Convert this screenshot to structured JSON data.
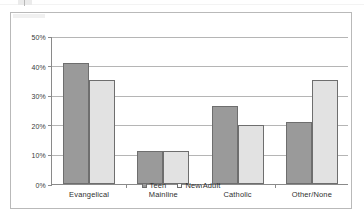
{
  "chart_data": {
    "type": "bar",
    "title": "",
    "subtitle": "",
    "xlabel": "",
    "ylabel": "",
    "categories": [
      "Evangelical",
      "Mainline",
      "Catholic",
      "Other/None"
    ],
    "series": [
      {
        "name": "Teen",
        "color": "#9a9a9a",
        "values": [
          41,
          11,
          26.5,
          21
        ]
      },
      {
        "name": "New Adult",
        "color": "#e2e2e2",
        "values": [
          35,
          11,
          20,
          35
        ]
      }
    ],
    "ylim": [
      0,
      50
    ],
    "ytick_values": [
      0,
      10,
      20,
      30,
      40,
      50
    ],
    "ytick_labels": [
      "0%",
      "10%",
      "20%",
      "30%",
      "40%",
      "50%"
    ],
    "grid": true,
    "legend_position": "bottom",
    "legend_entries": [
      "Teen",
      "New Adult"
    ],
    "annotations": []
  }
}
